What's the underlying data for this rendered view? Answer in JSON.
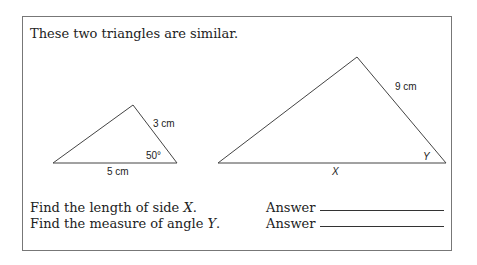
{
  "intro": "These two triangles are similar.",
  "small_triangle": {
    "side_right": "3 cm",
    "base": "5 cm",
    "angle": "50°"
  },
  "large_triangle": {
    "side_right": "9 cm",
    "base": "X",
    "angle": "Y"
  },
  "questions": [
    {
      "text_pre": "Find the length of side ",
      "var": "X",
      "text_post": ".",
      "answer_label": "Answer"
    },
    {
      "text_pre": "Find the measure of angle ",
      "var": "Y",
      "text_post": ".",
      "answer_label": "Answer"
    }
  ]
}
